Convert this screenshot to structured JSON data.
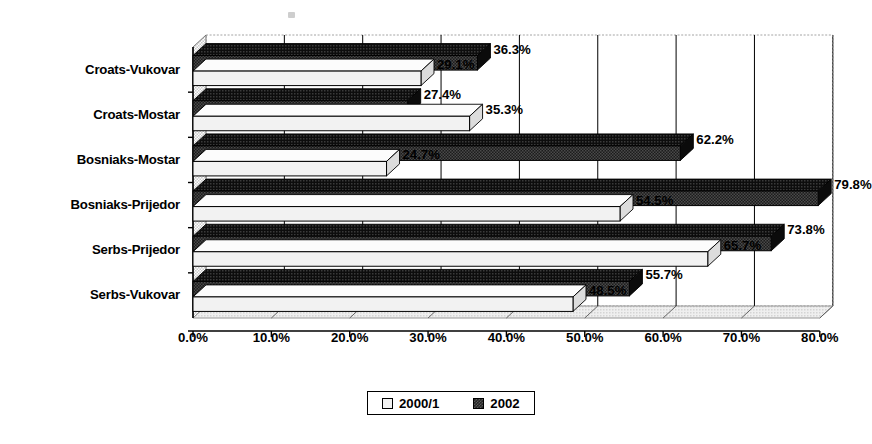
{
  "chart_data": {
    "type": "bar",
    "orientation": "horizontal",
    "title": "",
    "subtitle": "",
    "xlabel": "",
    "ylabel": "",
    "xlim": [
      0,
      80
    ],
    "xticks": [
      "0.0%",
      "10.0%",
      "20.0%",
      "30.0%",
      "40.0%",
      "50.0%",
      "60.0%",
      "70.0%",
      "80.0%"
    ],
    "xtick_values": [
      0,
      10,
      20,
      30,
      40,
      50,
      60,
      70,
      80
    ],
    "grid": true,
    "grid_axis": "x",
    "legend_position": "bottom",
    "style": "3d-bar",
    "categories": [
      "Croats-Vukovar",
      "Croats-Mostar",
      "Bosniaks-Mostar",
      "Bosniaks-Prijedor",
      "Serbs-Prijedor",
      "Serbs-Vukovar"
    ],
    "series": [
      {
        "name": "2000/1",
        "color": "#f2f2f2",
        "values": [
          29.1,
          35.3,
          24.7,
          54.5,
          65.7,
          48.5
        ],
        "labels": [
          "29.1%",
          "35.3%",
          "24.7%",
          "54.5%",
          "65.7%",
          "48.5%"
        ]
      },
      {
        "name": "2002",
        "color": "#262626",
        "values": [
          36.3,
          27.4,
          62.2,
          79.8,
          73.8,
          55.7
        ],
        "labels": [
          "36.3%",
          "27.4%",
          "62.2%",
          "79.8%",
          "73.8%",
          "55.7%"
        ]
      }
    ]
  },
  "legend": {
    "items": [
      {
        "label": "2000/1",
        "swatch": "light-swatch"
      },
      {
        "label": "2002",
        "swatch": "dark-swatch"
      }
    ]
  },
  "colors": {
    "series_light": "#f2f2f2",
    "series_dark": "#262626",
    "axis": "#000000",
    "grid": "#000000",
    "plot_background": "#ffffff",
    "page_background": "#ffffff"
  }
}
